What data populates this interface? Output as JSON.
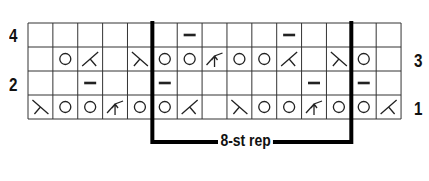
{
  "chart": {
    "rows": 4,
    "cols": 15,
    "grid": {
      "left": 28,
      "top": 23,
      "cell_w": 24.87,
      "cell_h": 24
    },
    "row_labels": [
      {
        "row": 4,
        "text": "4",
        "side": "left"
      },
      {
        "row": 3,
        "text": "3",
        "side": "right"
      },
      {
        "row": 2,
        "text": "2",
        "side": "left"
      },
      {
        "row": 1,
        "text": "1",
        "side": "right"
      }
    ],
    "cells": {
      "4": [
        "",
        "",
        "",
        "",
        "",
        "",
        "p",
        "",
        "",
        "",
        "p",
        "",
        "",
        "",
        ""
      ],
      "3": [
        "",
        "yo",
        "ssk",
        "",
        "k2tog",
        "yo",
        "yo",
        "cdd",
        "yo",
        "yo",
        "ssk",
        "",
        "k2tog",
        "yo",
        ""
      ],
      "2": [
        "",
        "",
        "p",
        "",
        "",
        "p",
        "",
        "",
        "",
        "",
        "",
        "p",
        "",
        "p",
        ""
      ],
      "1": [
        "k2tog",
        "yo",
        "yo",
        "cdd",
        "yo",
        "yo",
        "ssk",
        "",
        "k2tog",
        "yo",
        "yo",
        "cdd",
        "yo",
        "yo",
        "ssk"
      ]
    },
    "repeat": {
      "label": "8-st rep",
      "start_col": 6,
      "end_col": 13
    },
    "colors": {
      "line": "#333333",
      "symbol": "#222222",
      "rep_line": "#000000"
    }
  }
}
